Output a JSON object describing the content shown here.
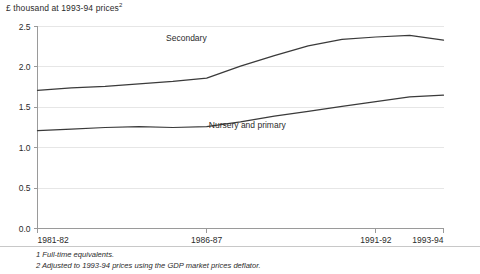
{
  "figure": {
    "unit_label_text": "£ thousand at 1993-94 prices",
    "unit_label_superscript": "2",
    "footnotes": [
      "1 Full-time equivalents.",
      "2 Adjusted to 1993-94 prices using the GDP market prices deflator."
    ],
    "colors": {
      "line": "#3a3a3a",
      "axis": "#9a9a9a",
      "grid": "#e6e6e6",
      "text": "#2b2b2b",
      "background": "#ffffff"
    }
  },
  "chart_data": {
    "type": "line",
    "title": "",
    "subtitle": "",
    "xlabel": "",
    "ylabel": "£ thousand at 1993-94 prices",
    "ylim": [
      0.0,
      2.5
    ],
    "xlim": [
      "1981-82",
      "1993-94"
    ],
    "grid": true,
    "legend": "inline-annotations",
    "y_ticks": [
      "0.0",
      "0.5",
      "1.0",
      "1.5",
      "2.0",
      "2.5"
    ],
    "y_tick_values": [
      0.0,
      0.5,
      1.0,
      1.5,
      2.0,
      2.5
    ],
    "x_tick_labels": [
      "1981-82",
      "1986-87",
      "1991-92",
      "1993-94"
    ],
    "x_tick_years": [
      1981,
      1986,
      1991,
      1993
    ],
    "x": [
      "1981-82",
      "1982-83",
      "1983-84",
      "1984-85",
      "1985-86",
      "1986-87",
      "1987-88",
      "1988-89",
      "1989-90",
      "1990-91",
      "1991-92",
      "1992-93",
      "1993-94"
    ],
    "x_years": [
      1981,
      1982,
      1983,
      1984,
      1985,
      1986,
      1987,
      1988,
      1989,
      1990,
      1991,
      1992,
      1993
    ],
    "series": [
      {
        "name": "Secondary",
        "label": "Secondary",
        "label_x_year": 1985.4,
        "label_y_value": 2.32,
        "values": [
          1.71,
          1.74,
          1.76,
          1.79,
          1.82,
          1.86,
          2.01,
          2.14,
          2.26,
          2.34,
          2.37,
          2.39,
          2.33
        ]
      },
      {
        "name": "Nursery and primary",
        "label": "Nursery and primary",
        "label_x_year": 1987.2,
        "label_y_value": 1.24,
        "values": [
          1.21,
          1.23,
          1.25,
          1.26,
          1.25,
          1.26,
          1.32,
          1.39,
          1.45,
          1.51,
          1.57,
          1.63,
          1.65
        ]
      }
    ]
  }
}
